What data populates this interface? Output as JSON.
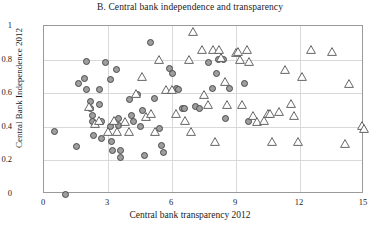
{
  "chart_data": {
    "type": "scatter",
    "title": "B. Central bank independence and transparency",
    "xlabel": "Central bank transparency 2012",
    "ylabel": "Central Bank Independence 2012",
    "xlim": [
      0,
      15
    ],
    "ylim": [
      0,
      1
    ],
    "xticks": [
      0,
      3,
      6,
      9,
      12,
      15
    ],
    "yticks": [
      0,
      0.2,
      0.4,
      0.6,
      0.8,
      1
    ],
    "xtick_labels": [
      "0",
      "3",
      "6",
      "9",
      "12",
      "15"
    ],
    "ytick_labels": [
      "0",
      "0.2",
      "0.4",
      "0.6",
      "0.8",
      "1"
    ],
    "grid": true,
    "legend": null,
    "series": [
      {
        "name": "circle-series",
        "marker": "circle",
        "fill_color": "#9e9e9e",
        "edge_color": "#4a4a4a",
        "points": [
          [
            1.0,
            0.0
          ],
          [
            0.5,
            0.37
          ],
          [
            1.5,
            0.28
          ],
          [
            1.6,
            0.66
          ],
          [
            1.9,
            0.69
          ],
          [
            2.0,
            0.62
          ],
          [
            2.2,
            0.55
          ],
          [
            2.2,
            0.51
          ],
          [
            2.25,
            0.47
          ],
          [
            2.25,
            0.43
          ],
          [
            2.3,
            0.35
          ],
          [
            2.6,
            0.62
          ],
          [
            2.6,
            0.53
          ],
          [
            2.7,
            0.43
          ],
          [
            2.7,
            0.33
          ],
          [
            3.1,
            0.68
          ],
          [
            3.1,
            0.4
          ],
          [
            3.15,
            0.31
          ],
          [
            3.2,
            0.26
          ],
          [
            3.4,
            0.74
          ],
          [
            3.5,
            0.45
          ],
          [
            3.5,
            0.41
          ],
          [
            3.6,
            0.26
          ],
          [
            3.6,
            0.22
          ],
          [
            4.0,
            0.56
          ],
          [
            4.1,
            0.47
          ],
          [
            4.2,
            0.43
          ],
          [
            4.4,
            0.59
          ],
          [
            4.5,
            0.4
          ],
          [
            4.6,
            0.5
          ],
          [
            4.7,
            0.23
          ],
          [
            5.0,
            0.9
          ],
          [
            5.2,
            0.57
          ],
          [
            5.4,
            0.39
          ],
          [
            5.5,
            0.29
          ],
          [
            5.6,
            0.25
          ],
          [
            5.9,
            0.75
          ],
          [
            6.2,
            0.63
          ],
          [
            6.3,
            0.62
          ],
          [
            6.5,
            0.51
          ],
          [
            6.6,
            0.51
          ],
          [
            7.1,
            0.52
          ],
          [
            7.3,
            0.51
          ],
          [
            7.7,
            0.78
          ],
          [
            7.9,
            0.63
          ],
          [
            8.1,
            0.72
          ],
          [
            8.2,
            0.8
          ],
          [
            8.4,
            0.8
          ],
          [
            8.5,
            0.45
          ],
          [
            8.7,
            0.63
          ],
          [
            9.4,
            0.66
          ],
          [
            9.6,
            0.43
          ],
          [
            2.0,
            0.79
          ],
          [
            2.9,
            0.78
          ],
          [
            6.0,
            0.72
          ]
        ]
      },
      {
        "name": "triangle-series",
        "marker": "triangle",
        "fill_color": "#ffffff",
        "edge_color": "#555555",
        "points": [
          [
            2.1,
            0.52
          ],
          [
            2.4,
            0.42
          ],
          [
            2.6,
            0.44
          ],
          [
            3.0,
            0.37
          ],
          [
            3.3,
            0.44
          ],
          [
            3.4,
            0.37
          ],
          [
            3.8,
            0.43
          ],
          [
            4.0,
            0.37
          ],
          [
            4.3,
            0.6
          ],
          [
            4.6,
            0.7
          ],
          [
            4.8,
            0.46
          ],
          [
            5.4,
            0.8
          ],
          [
            5.7,
            0.62
          ],
          [
            6.0,
            0.62
          ],
          [
            6.2,
            0.48
          ],
          [
            6.6,
            0.44
          ],
          [
            6.9,
            0.37
          ],
          [
            7.0,
            0.97
          ],
          [
            7.4,
            0.86
          ],
          [
            7.5,
            0.59
          ],
          [
            7.7,
            0.53
          ],
          [
            7.9,
            0.86
          ],
          [
            8.2,
            0.86
          ],
          [
            8.3,
            0.81
          ],
          [
            8.5,
            0.67
          ],
          [
            8.6,
            0.53
          ],
          [
            9.0,
            0.84
          ],
          [
            9.1,
            0.85
          ],
          [
            9.2,
            0.8
          ],
          [
            9.3,
            0.53
          ],
          [
            9.5,
            0.86
          ],
          [
            9.6,
            0.79
          ],
          [
            9.8,
            0.47
          ],
          [
            10.0,
            0.43
          ],
          [
            10.3,
            0.44
          ],
          [
            10.5,
            0.48
          ],
          [
            10.6,
            0.48
          ],
          [
            10.7,
            0.31
          ],
          [
            11.0,
            0.49
          ],
          [
            11.3,
            0.74
          ],
          [
            11.6,
            0.54
          ],
          [
            11.7,
            0.47
          ],
          [
            12.1,
            0.7
          ],
          [
            12.5,
            0.86
          ],
          [
            13.5,
            0.85
          ],
          [
            14.1,
            0.3
          ],
          [
            14.3,
            0.66
          ],
          [
            14.9,
            0.41
          ],
          [
            15.0,
            0.39
          ],
          [
            5.0,
            0.48
          ],
          [
            5.2,
            0.37
          ],
          [
            6.8,
            0.8
          ],
          [
            8.0,
            0.31
          ],
          [
            11.9,
            0.31
          ]
        ]
      }
    ]
  }
}
